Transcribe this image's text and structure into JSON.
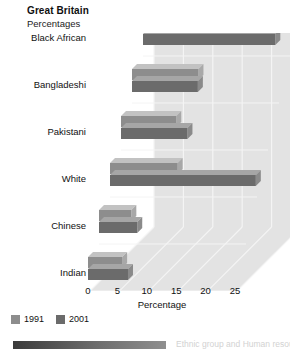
{
  "header": {
    "title": "Great Britain",
    "subtitle": "Percentages"
  },
  "axis": {
    "x_title": "Percentage",
    "ticks": [
      "0",
      "5",
      "10",
      "15",
      "20",
      "25"
    ]
  },
  "legend": {
    "items": [
      {
        "label": "1991",
        "color": "#8d8d8d"
      },
      {
        "label": "2001",
        "color": "#6b6b6b"
      }
    ]
  },
  "footer": {
    "caption": "Ethnic group and Human resources in..."
  },
  "colors": {
    "plot_background": "#e3e3e3",
    "gridline": "#f4f4f4",
    "series_1991_front": "#8d8d8d",
    "series_1991_top": "#c2c2c2",
    "series_1991_side": "#a8a8a8",
    "series_2001_front": "#6b6b6b",
    "series_2001_top": "#a6a6a6",
    "series_2001_side": "#8a8a8a",
    "text": "#111111"
  },
  "chart_data": {
    "type": "bar",
    "orientation": "horizontal",
    "title": "Great Britain",
    "subtitle": "Percentages",
    "xlabel": "Percentage",
    "ylabel": "",
    "xlim": [
      0,
      25
    ],
    "xticks": [
      0,
      5,
      10,
      15,
      20,
      25
    ],
    "grid": true,
    "legend_position": "bottom-left",
    "categories": [
      "Black Caribbean",
      "Black African",
      "Bangladeshi",
      "Pakistani",
      "White",
      "Chinese",
      "Indian"
    ],
    "series": [
      {
        "name": "1991",
        "values": [
          25.0,
          23.5,
          11.3,
          9.4,
          11.5,
          5.5,
          5.8
        ]
      },
      {
        "name": "2001",
        "values": [
          23.0,
          22.5,
          11.2,
          11.3,
          24.8,
          6.5,
          6.8
        ]
      }
    ]
  }
}
